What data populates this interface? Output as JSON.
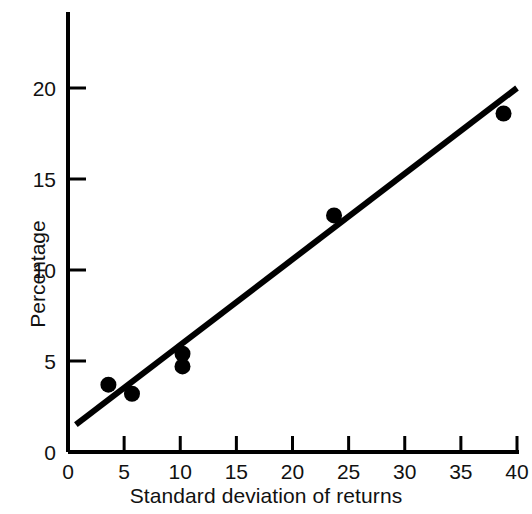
{
  "chart_data": {
    "type": "scatter",
    "title": "",
    "xlabel": "Standard deviation of returns",
    "ylabel": "Percentage",
    "xlim": [
      0,
      40
    ],
    "ylim": [
      0,
      21.5
    ],
    "xticks": [
      0,
      5,
      10,
      15,
      20,
      25,
      30,
      35,
      40
    ],
    "xtick_labels": [
      "0",
      "5",
      "10",
      "15",
      "20",
      "25",
      "30",
      "35",
      "40"
    ],
    "yticks": [
      0,
      5,
      10,
      15,
      20
    ],
    "ytick_labels": [
      "0",
      "5",
      "10",
      "15",
      "20"
    ],
    "grid": false,
    "legend": null,
    "series": [
      {
        "name": "Observations",
        "type": "scatter",
        "marker": "filled-circle",
        "color": "#000000",
        "points": [
          {
            "x": 3.6,
            "y": 3.7
          },
          {
            "x": 5.7,
            "y": 3.2
          },
          {
            "x": 10.2,
            "y": 5.4
          },
          {
            "x": 10.2,
            "y": 4.7
          },
          {
            "x": 23.7,
            "y": 13.0
          },
          {
            "x": 38.8,
            "y": 18.6
          }
        ]
      },
      {
        "name": "Fitted regression line",
        "type": "line",
        "color": "#000000",
        "points": [
          {
            "x": 0.7,
            "y": 1.5
          },
          {
            "x": 40.0,
            "y": 20.0
          }
        ]
      }
    ]
  },
  "axis": {
    "x_title": "Standard deviation of returns",
    "y_title": "Percentage"
  }
}
